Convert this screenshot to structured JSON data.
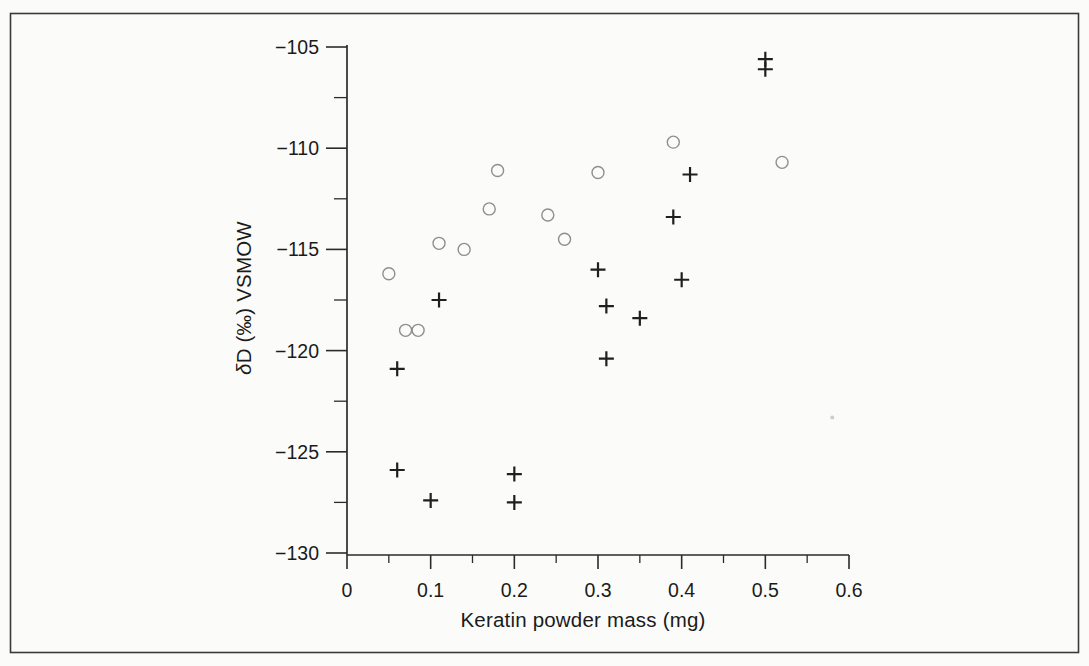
{
  "figure": {
    "background": "#fbfbf9",
    "border_color": "#3a3a3a",
    "text_color": "#1b1b1b"
  },
  "labels": {
    "x_axis_title": "Keratin powder mass (mg)",
    "y_axis_title": "δD (‰) VSMOW",
    "y_axis_title_delta": "δ",
    "y_axis_title_rest": "D (‰) VSMOW"
  },
  "chart_data": {
    "type": "scatter",
    "title": "",
    "xlabel": "Keratin powder mass (mg)",
    "ylabel": "δD (‰) VSMOW",
    "xlim": [
      0,
      0.6
    ],
    "ylim": [
      -130,
      -105
    ],
    "x_ticks": [
      0,
      0.1,
      0.2,
      0.3,
      0.4,
      0.5,
      0.6
    ],
    "x_tick_labels": [
      "0",
      "0.1",
      "0.2",
      "0.3",
      "0.4",
      "0.5",
      "0.6"
    ],
    "x_minor_step": 0.05,
    "y_ticks": [
      -105,
      -110,
      -115,
      -120,
      -125,
      -130
    ],
    "y_tick_labels": [
      "−105",
      "−110",
      "−115",
      "−120",
      "−125",
      "−130"
    ],
    "y_minor_step": 2.5,
    "grid": false,
    "legend": "none",
    "marker_style": {
      "circle_stroke": "#8f8f8f",
      "circle_radius": 6,
      "plus_stroke": "#1f1f1f",
      "plus_arm": 7.5
    },
    "series": [
      {
        "name": "open-circle series",
        "marker": "open-circle",
        "points": [
          [
            0.05,
            -116.2
          ],
          [
            0.07,
            -119.0
          ],
          [
            0.085,
            -119.0
          ],
          [
            0.11,
            -114.7
          ],
          [
            0.14,
            -115.0
          ],
          [
            0.17,
            -113.0
          ],
          [
            0.18,
            -111.1
          ],
          [
            0.24,
            -113.3
          ],
          [
            0.26,
            -114.5
          ],
          [
            0.3,
            -111.2
          ],
          [
            0.39,
            -109.7
          ],
          [
            0.52,
            -110.7
          ]
        ]
      },
      {
        "name": "plus series",
        "marker": "plus",
        "points": [
          [
            0.06,
            -120.9
          ],
          [
            0.06,
            -125.9
          ],
          [
            0.1,
            -127.4
          ],
          [
            0.11,
            -117.5
          ],
          [
            0.2,
            -126.1
          ],
          [
            0.2,
            -127.5
          ],
          [
            0.3,
            -116.0
          ],
          [
            0.31,
            -117.8
          ],
          [
            0.31,
            -120.4
          ],
          [
            0.35,
            -118.4
          ],
          [
            0.39,
            -113.4
          ],
          [
            0.4,
            -116.5
          ],
          [
            0.41,
            -111.3
          ],
          [
            0.5,
            -105.6
          ],
          [
            0.5,
            -106.1
          ]
        ]
      }
    ],
    "scan_artifact_dot": {
      "note": "faint speck on scan",
      "x": 0.58,
      "y": -123.3
    }
  }
}
